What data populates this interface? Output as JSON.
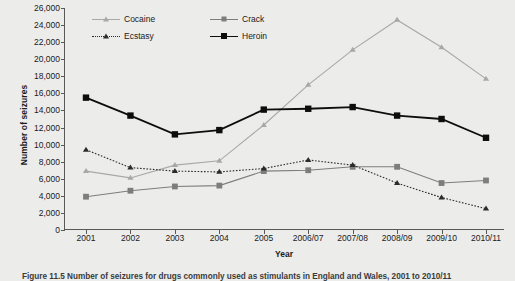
{
  "chart_data": {
    "type": "line",
    "title": "",
    "xlabel": "Year",
    "ylabel": "Number of seizures",
    "categories": [
      "2001",
      "2002",
      "2003",
      "2004",
      "2005",
      "2006/07",
      "2007/08",
      "2008/09",
      "2009/10",
      "2010/11"
    ],
    "ylim": [
      0,
      26000
    ],
    "ytick_step": 2000,
    "yticks": [
      "0",
      "2,000",
      "4,000",
      "6,000",
      "8,000",
      "10,000",
      "12,000",
      "14,000",
      "16,000",
      "18,000",
      "20,000",
      "22,000",
      "24,000",
      "26,000"
    ],
    "grid": false,
    "legend_position": "top-center-inside",
    "series": [
      {
        "name": "Cocaine",
        "color": "#a8a8a8",
        "marker": "triangle",
        "linestyle": "solid",
        "values": [
          6900,
          6100,
          7600,
          8100,
          12300,
          17000,
          21100,
          24600,
          21400,
          17700
        ]
      },
      {
        "name": "Crack",
        "color": "#7d7d7d",
        "marker": "square",
        "linestyle": "solid",
        "values": [
          3900,
          4600,
          5100,
          5200,
          6900,
          7000,
          7400,
          7400,
          5500,
          5800
        ]
      },
      {
        "name": "Ecstasy",
        "color": "#2b2b2b",
        "marker": "triangle",
        "linestyle": "dotted",
        "values": [
          9400,
          7300,
          6900,
          6800,
          7200,
          8200,
          7600,
          5500,
          3800,
          2500
        ]
      },
      {
        "name": "Heroin",
        "color": "#0d0d0d",
        "marker": "square",
        "linestyle": "solid",
        "values": [
          15500,
          13400,
          11200,
          11700,
          14100,
          14200,
          14400,
          13400,
          13000,
          10800
        ]
      }
    ]
  },
  "caption": {
    "text": "Figure 11.5 Number of seizures for drugs commonly used as stimulants in England and Wales, 2001 to 2010/11"
  }
}
